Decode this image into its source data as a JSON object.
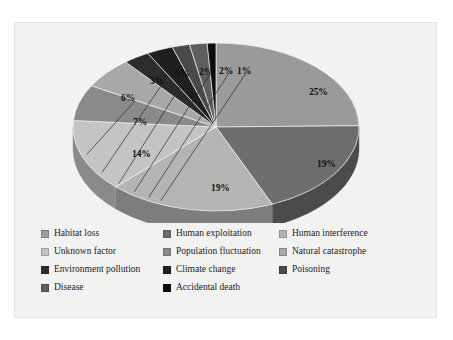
{
  "panel": {
    "background": "#f2f2f1",
    "border_color": "#e3e3e1"
  },
  "chart_data": {
    "type": "pie",
    "title": "",
    "subtitle": "",
    "xlabel": "",
    "ylabel": "",
    "grid": false,
    "three_d": true,
    "legend_position": "bottom",
    "start_angle_deg": 0,
    "direction": "clockwise",
    "units": "percent",
    "categories": [
      "Habitat loss",
      "Human exploitation",
      "Human interference",
      "Unknown factor",
      "Population fluctuation",
      "Natural catastrophe",
      "Environment pollution",
      "Climate change",
      "Poisoning",
      "Disease",
      "Accidental death"
    ],
    "values": [
      25,
      19,
      19,
      14,
      7,
      6,
      3,
      3,
      2,
      2,
      1
    ],
    "labels": [
      "25%",
      "19%",
      "19%",
      "14%",
      "7%",
      "6%",
      "3%",
      "3%",
      "2%",
      "2%",
      "1%"
    ],
    "colors": [
      "#9a9a9a",
      "#6e6e6e",
      "#b4b4b4",
      "#c4c4c4",
      "#8a8a8a",
      "#a8a8a8",
      "#2c2c2c",
      "#1f1f1f",
      "#4a4a4a",
      "#5e5e5e",
      "#0d0d0d"
    ],
    "side_colors": [
      "#6b6b6b",
      "#4b4b4b",
      "#7d7d7d",
      "#8a8a8a",
      "#5f5f5f",
      "#747474",
      "#1d1d1d",
      "#141414",
      "#333333",
      "#414141",
      "#080808"
    ]
  },
  "slice_labels": [
    {
      "text": "25%",
      "x": 294,
      "y": 64,
      "tone": "dark",
      "leader": false
    },
    {
      "text": "19%",
      "x": 302,
      "y": 136,
      "tone": "dark",
      "leader": false
    },
    {
      "text": "19%",
      "x": 196,
      "y": 160,
      "tone": "dark",
      "leader": false
    },
    {
      "text": "14%",
      "x": 117,
      "y": 126,
      "tone": "dark",
      "leader": false
    },
    {
      "text": "7%",
      "x": 118,
      "y": 94,
      "tone": "light",
      "leader": false
    },
    {
      "text": "6%",
      "x": 106,
      "y": 70,
      "tone": "dark",
      "leader": true
    },
    {
      "text": "3%",
      "x": 135,
      "y": 53,
      "tone": "dark",
      "leader": true
    },
    {
      "text": "3%",
      "x": 160,
      "y": 46,
      "tone": "dark",
      "leader": true
    },
    {
      "text": "2%",
      "x": 184,
      "y": 44,
      "tone": "dark",
      "leader": true
    },
    {
      "text": "2%",
      "x": 204,
      "y": 43,
      "tone": "dark",
      "leader": true
    },
    {
      "text": "1%",
      "x": 222,
      "y": 43,
      "tone": "dark",
      "leader": true
    }
  ],
  "legend": {
    "rows": [
      [
        {
          "label": "Habitat loss",
          "color": "#9a9a9a"
        },
        {
          "label": "Human exploitation",
          "color": "#6e6e6e"
        },
        {
          "label": "Human interference",
          "color": "#b4b4b4"
        }
      ],
      [
        {
          "label": "Unknown factor",
          "color": "#c4c4c4"
        },
        {
          "label": "Population fluctuation",
          "color": "#8a8a8a"
        },
        {
          "label": "Natural catastrophe",
          "color": "#a8a8a8"
        }
      ],
      [
        {
          "label": "Environment pollution",
          "color": "#2c2c2c"
        },
        {
          "label": "Climate change",
          "color": "#1f1f1f"
        },
        {
          "label": "Poisoning",
          "color": "#4a4a4a"
        }
      ],
      [
        {
          "label": "Disease",
          "color": "#5e5e5e"
        },
        {
          "label": "Accidental death",
          "color": "#0d0d0d"
        },
        {
          "label": "",
          "color": ""
        }
      ]
    ]
  }
}
